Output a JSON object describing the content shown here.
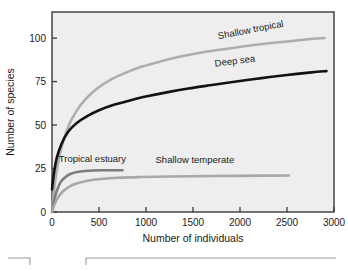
{
  "figure": {
    "caption": "Figure 11.8"
  },
  "chart_data": {
    "type": "line",
    "title": "",
    "xlabel": "Number of individuals",
    "ylabel": "Number of species",
    "xlim": [
      0,
      3000
    ],
    "ylim": [
      0,
      115
    ],
    "xticks": [
      0,
      500,
      1000,
      1500,
      2000,
      2500,
      3000
    ],
    "xtick_labels": [
      "0",
      "500",
      "1000",
      "1500",
      "2000",
      "2500",
      "3000"
    ],
    "yticks": [
      0,
      25,
      50,
      75,
      100
    ],
    "ytick_labels": [
      "0",
      "25",
      "50",
      "75",
      "100"
    ],
    "grid": false,
    "legend": "inline-labels",
    "background": "#eeeeee",
    "frame_color": "#3a3a3a",
    "series": [
      {
        "name": "Shallow tropical",
        "color": "#adadad",
        "label_x": 2120,
        "label_y": 103,
        "label_rotation": -11,
        "x": [
          0,
          25,
          60,
          110,
          180,
          260,
          360,
          480,
          620,
          780,
          950,
          1150,
          1380,
          1620,
          1880,
          2150,
          2430,
          2700,
          2900
        ],
        "y": [
          0,
          14,
          27,
          39,
          50,
          58,
          65,
          71,
          76,
          80,
          83.5,
          86.5,
          89.5,
          92,
          94,
          96,
          97.7,
          99.2,
          100
        ]
      },
      {
        "name": "Deep sea",
        "color": "#121212",
        "label_x": 1950,
        "label_y": 85,
        "label_rotation": -7,
        "x": [
          0,
          20,
          50,
          100,
          170,
          260,
          370,
          500,
          650,
          820,
          1010,
          1220,
          1450,
          1700,
          1960,
          2230,
          2500,
          2760,
          2920
        ],
        "y": [
          13,
          22,
          31,
          39,
          46,
          51,
          55,
          58.5,
          61.5,
          64,
          66.5,
          68.8,
          71,
          73,
          75,
          77,
          78.8,
          80.3,
          81
        ]
      },
      {
        "name": "Tropical estuary",
        "color": "#7d7d7d",
        "label_x": 430,
        "label_y": 29,
        "label_rotation": 0,
        "x": [
          0,
          20,
          50,
          90,
          140,
          200,
          270,
          350,
          440,
          540,
          640,
          750
        ],
        "y": [
          0,
          6,
          12,
          17,
          20,
          22,
          23,
          23.6,
          23.9,
          24,
          24,
          24
        ]
      },
      {
        "name": "Shallow temperate",
        "color": "#a8a8a8",
        "label_x": 1520,
        "label_y": 28,
        "label_rotation": 0,
        "x": [
          0,
          25,
          60,
          110,
          180,
          270,
          380,
          520,
          700,
          950,
          1250,
          1600,
          1950,
          2250,
          2520
        ],
        "y": [
          0,
          4,
          8,
          11.5,
          14.5,
          16.5,
          18,
          19,
          19.7,
          20.1,
          20.4,
          20.6,
          20.8,
          20.9,
          21
        ]
      }
    ]
  }
}
